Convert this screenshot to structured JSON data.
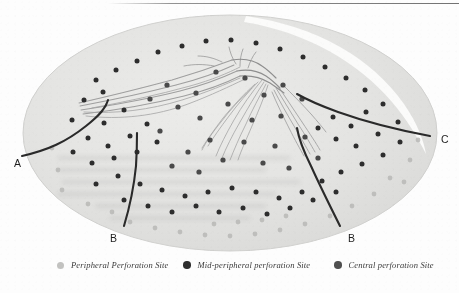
{
  "figure": {
    "kind": "retina-flatmount-diagram",
    "background_color": "#ffffff",
    "globe": {
      "fill_color": "#e3e3e1",
      "edge_color": "#d2d2d0",
      "highlight_color": "#fbfbfa",
      "cx": 230,
      "cy": 133,
      "rx": 207,
      "ry": 118
    },
    "boundary_line_color": "#2a2a2a",
    "vessel_color_primary": "#8a8a8a",
    "vessel_color_secondary": "#a9a9a9",
    "dot_colors": {
      "central": "#4a4a4a",
      "mid_peripheral": "#2d2d2d",
      "peripheral": "#b9b9b7"
    }
  },
  "labels": [
    {
      "id": "label-a",
      "text": "A",
      "x": 14,
      "y": 157
    },
    {
      "id": "label-b-left",
      "text": "B",
      "x": 110,
      "y": 232
    },
    {
      "id": "label-b-right",
      "text": "B",
      "x": 348,
      "y": 232
    },
    {
      "id": "label-c",
      "text": "C",
      "x": 441,
      "y": 133
    }
  ],
  "legend": {
    "items": [
      {
        "id": "legend-peripheral",
        "label": "Peripheral Perforation Site",
        "marker_color": "#c2c2c0",
        "marker_size": 7,
        "x": 57,
        "text_x": 72
      },
      {
        "id": "legend-mid-peripheral",
        "label": "Mid-peripheral perforation Site",
        "marker_color": "#2e2e2e",
        "marker_size": 7.5,
        "x": 183,
        "text_x": 198
      },
      {
        "id": "legend-central",
        "label": "Central perforation Site",
        "marker_color": "#4f4f4f",
        "marker_size": 7.5,
        "x": 334,
        "text_x": 349
      }
    ]
  },
  "chart_data": {
    "type": "scatter",
    "title": "",
    "xlabel": "",
    "ylabel": "",
    "legend_position": "bottom",
    "grid": false,
    "series": [
      {
        "name": "Central perforation Site",
        "color": "#4a4a4a",
        "radius": 2.6,
        "points": [
          [
            167,
            85
          ],
          [
            196,
            93
          ],
          [
            216,
            72
          ],
          [
            245,
            78
          ],
          [
            264,
            95
          ],
          [
            283,
            85
          ],
          [
            228,
            104
          ],
          [
            200,
            118
          ],
          [
            252,
            120
          ],
          [
            281,
            116
          ],
          [
            178,
            107
          ],
          [
            302,
            99
          ],
          [
            150,
            99
          ],
          [
            210,
            140
          ],
          [
            244,
            142
          ],
          [
            275,
            146
          ],
          [
            188,
            152
          ],
          [
            305,
            137
          ],
          [
            160,
            131
          ],
          [
            223,
            160
          ],
          [
            263,
            163
          ],
          [
            199,
            172
          ],
          [
            289,
            168
          ],
          [
            172,
            166
          ],
          [
            318,
            158
          ]
        ]
      },
      {
        "name": "Mid-peripheral perforation Site",
        "color": "#2d2d2d",
        "radius": 2.5,
        "points": [
          [
            96,
            80
          ],
          [
            116,
            70
          ],
          [
            137,
            61
          ],
          [
            158,
            52
          ],
          [
            182,
            46
          ],
          [
            206,
            41
          ],
          [
            231,
            40
          ],
          [
            256,
            43
          ],
          [
            280,
            49
          ],
          [
            303,
            57
          ],
          [
            325,
            67
          ],
          [
            346,
            78
          ],
          [
            365,
            90
          ],
          [
            84,
            100
          ],
          [
            103,
            92
          ],
          [
            124,
            110
          ],
          [
            104,
            123
          ],
          [
            88,
            138
          ],
          [
            108,
            146
          ],
          [
            130,
            136
          ],
          [
            147,
            124
          ],
          [
            366,
            112
          ],
          [
            351,
            126
          ],
          [
            333,
            117
          ],
          [
            383,
            104
          ],
          [
            398,
            122
          ],
          [
            378,
            134
          ],
          [
            356,
            146
          ],
          [
            336,
            139
          ],
          [
            318,
            128
          ],
          [
            72,
            120
          ],
          [
            73,
            152
          ],
          [
            92,
            163
          ],
          [
            114,
            158
          ],
          [
            137,
            152
          ],
          [
            157,
            142
          ],
          [
            400,
            142
          ],
          [
            383,
            155
          ],
          [
            362,
            164
          ],
          [
            341,
            172
          ],
          [
            322,
            181
          ],
          [
            96,
            184
          ],
          [
            118,
            176
          ],
          [
            140,
            184
          ],
          [
            162,
            190
          ],
          [
            185,
            196
          ],
          [
            208,
            192
          ],
          [
            232,
            188
          ],
          [
            256,
            192
          ],
          [
            279,
            198
          ],
          [
            302,
            192
          ],
          [
            124,
            200
          ],
          [
            148,
            206
          ],
          [
            172,
            212
          ],
          [
            196,
            206
          ],
          [
            219,
            212
          ],
          [
            243,
            208
          ],
          [
            267,
            214
          ],
          [
            290,
            208
          ],
          [
            313,
            200
          ],
          [
            336,
            192
          ]
        ]
      },
      {
        "name": "Peripheral Perforation Site",
        "color": "#b9b9b7",
        "radius": 2.4,
        "points": [
          [
            130,
            222
          ],
          [
            155,
            228
          ],
          [
            180,
            232
          ],
          [
            205,
            235
          ],
          [
            230,
            236
          ],
          [
            255,
            234
          ],
          [
            280,
            230
          ],
          [
            305,
            224
          ],
          [
            330,
            216
          ],
          [
            112,
            212
          ],
          [
            352,
            206
          ],
          [
            374,
            194
          ],
          [
            390,
            178
          ],
          [
            58,
            170
          ],
          [
            52,
            148
          ],
          [
            62,
            190
          ],
          [
            88,
            204
          ],
          [
            410,
            160
          ],
          [
            418,
            140
          ],
          [
            404,
            182
          ],
          [
            238,
            222
          ],
          [
            214,
            224
          ],
          [
            262,
            220
          ],
          [
            286,
            216
          ]
        ]
      }
    ],
    "boundary_curves": [
      {
        "name": "curve-A",
        "label": "A",
        "path": "M 22,156 C 48,150 66,142 86,126 C 100,115 106,108 108,100"
      },
      {
        "name": "curve-B-left",
        "label": "B",
        "path": "M 124,226 C 130,206 134,186 136,166 C 137,150 137,140 137,133"
      },
      {
        "name": "curve-B-right",
        "label": "B",
        "path": "M 340,226 C 330,206 320,186 311,166 C 303,150 299,140 297,128"
      },
      {
        "name": "curve-C",
        "label": "C",
        "path": "M 430,136 C 398,130 366,122 338,112 C 316,104 304,98 297,94"
      }
    ]
  }
}
